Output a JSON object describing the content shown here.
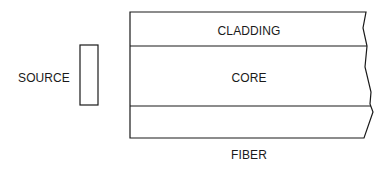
{
  "diagram": {
    "labels": {
      "source": "SOURCE",
      "cladding": "CLADDING",
      "core": "CORE",
      "fiber": "FIBER"
    },
    "colors": {
      "stroke": "#1a1a1a",
      "background": "#ffffff"
    }
  }
}
